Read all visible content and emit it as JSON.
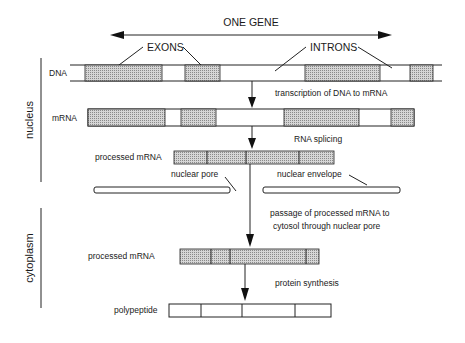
{
  "title": "ONE GENE",
  "labels": {
    "exons": "EXONS",
    "introns": "INTRONS",
    "dna": "DNA",
    "mrna": "mRNA",
    "processed_mrna_nucleus": "processed mRNA",
    "processed_mrna_cytoplasm": "processed mRNA",
    "polypeptide": "polypeptide",
    "nuclear_pore": "nuclear pore",
    "nuclear_envelope": "nuclear envelope"
  },
  "regions": {
    "nucleus": "nucleus",
    "cytoplasm": "cytoplasm"
  },
  "steps": {
    "transcription": "transcription of DNA to mRNA",
    "splicing": "RNA splicing",
    "passage_line1": "passage of processed mRNA to",
    "passage_line2": "cytosol through nuclear pore",
    "protein_synthesis": "protein synthesis"
  },
  "colors": {
    "exon_fill": "#c8c8c8",
    "line": "#222222"
  }
}
